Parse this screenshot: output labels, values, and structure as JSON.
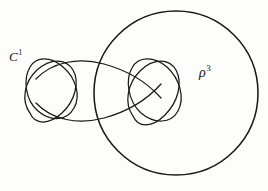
{
  "figure": {
    "background_color": "#fdfdfc",
    "ink_color": "#1a1a1a",
    "width": 268,
    "height": 191,
    "labels": {
      "curve": {
        "base": "C",
        "superscript": "1",
        "text": "C¹"
      },
      "region": {
        "base": "ρ",
        "superscript": "3",
        "text": "ρ³"
      }
    },
    "elements": {
      "big_circle": {
        "name": "large-circle",
        "label": "ρ³",
        "center_x": 176,
        "center_y": 93,
        "radius": 82,
        "stroke_width": 1.5
      },
      "knot_curve": {
        "name": "knot-curve",
        "label": "C¹",
        "description": "closed curve with two bowtie loop clusters joined by two long arcs",
        "stroke_width": 1.2,
        "clusters": [
          {
            "name": "left-bowtie",
            "center_x": 46,
            "center_y": 90
          },
          {
            "name": "middle-bowtie",
            "center_x": 150,
            "center_y": 90
          }
        ],
        "connecting_arcs": [
          {
            "name": "upper-arc",
            "from_x": 58,
            "from_y": 64,
            "to_x": 146,
            "to_y": 62
          },
          {
            "name": "lower-arc",
            "from_x": 58,
            "from_y": 116,
            "to_x": 146,
            "to_y": 118
          }
        ],
        "intersections": [
          {
            "name": "upper-crossing",
            "x": 103,
            "y": 65
          },
          {
            "name": "lower-crossing",
            "x": 103,
            "y": 117
          }
        ]
      }
    }
  }
}
